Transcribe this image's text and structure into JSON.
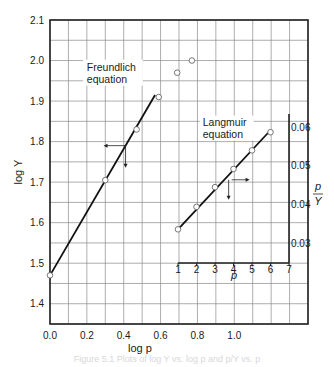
{
  "chart_data": [
    {
      "name": "freundlich",
      "type": "scatter",
      "title": "",
      "xlabel": "log p",
      "ylabel": "log Y",
      "xlim": [
        0.0,
        1.4
      ],
      "ylim": [
        1.35,
        2.1
      ],
      "x_ticks": [
        0.0,
        0.2,
        0.4,
        0.6,
        0.8,
        1.0
      ],
      "x_tick_labels": [
        "0.0",
        "0.2",
        "0.4",
        "0.6",
        "0.8",
        "1.0"
      ],
      "y_ticks": [
        1.4,
        1.5,
        1.6,
        1.7,
        1.8,
        1.9,
        2.0,
        2.1
      ],
      "y_tick_labels": [
        "1.4",
        "1.5",
        "1.6",
        "1.7",
        "1.8",
        "1.9",
        "2.0",
        "2.1"
      ],
      "grid": true,
      "grid_x_step": 0.1,
      "grid_y_step": 0.05,
      "series": [
        {
          "name": "Freundlich data",
          "x": [
            0.0,
            0.3,
            0.47,
            0.59,
            0.69,
            0.77
          ],
          "y": [
            1.47,
            1.705,
            1.83,
            1.91,
            1.97,
            2.0
          ],
          "marker": "open-circle"
        }
      ],
      "fit_line": {
        "x": [
          0.0,
          0.57
        ],
        "y": [
          1.47,
          1.915
        ]
      },
      "annotation": {
        "text_line1": "Freundlich",
        "text_line2": "equation",
        "x": 0.2,
        "y": 1.975
      },
      "axis_arrows": {
        "x": 0.41,
        "y": 1.79,
        "horizontal": "left",
        "vertical": "down"
      }
    },
    {
      "name": "langmuir-inset",
      "type": "scatter",
      "title": "",
      "xlabel": "p",
      "ylabel": "p/Y",
      "ylabel_num": "p",
      "ylabel_den": "Y",
      "xlim": [
        1,
        7
      ],
      "ylim": [
        0.025,
        0.0635
      ],
      "x_ticks": [
        1,
        2,
        3,
        4,
        5,
        6,
        7
      ],
      "x_tick_labels": [
        "1",
        "2",
        "3",
        "4",
        "5",
        "6",
        "7"
      ],
      "y_ticks": [
        0.03,
        0.04,
        0.05,
        0.06
      ],
      "y_tick_labels": [
        "0.03",
        "0.04",
        "0.05",
        "0.06"
      ],
      "y_axis_position": "right",
      "grid": true,
      "series": [
        {
          "name": "Langmuir data",
          "x": [
            1,
            2,
            3,
            4,
            5,
            6
          ],
          "y": [
            0.0337,
            0.0395,
            0.0446,
            0.0493,
            0.0541,
            0.0588
          ],
          "marker": "open-circle"
        }
      ],
      "fit_line": {
        "x": [
          1,
          6
        ],
        "y": [
          0.0337,
          0.0593
        ]
      },
      "annotation": {
        "text_line1": "Langmuir",
        "text_line2": "equation",
        "x": 3.85,
        "y": 0.0605
      },
      "axis_arrows": {
        "x": 3.9,
        "y": 0.0465,
        "horizontal": "right",
        "vertical": "down"
      }
    }
  ],
  "caption": "Figure 5.1  Plots of log Y vs. log p and p/Y vs. p",
  "colors": {
    "line": "#111111",
    "grid": "#8a8a8a",
    "frame": "#222222",
    "marker_fill": "#ffffff"
  }
}
